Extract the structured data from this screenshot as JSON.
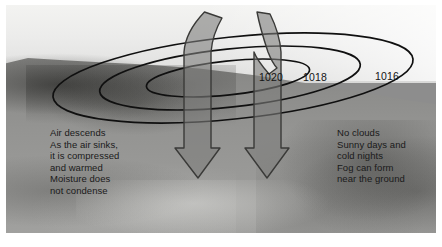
{
  "photo": {
    "description": "grayscale landscape photograph with sloping ridge and sky"
  },
  "isobars": {
    "label_units": "mb",
    "labels": [
      {
        "value": "1020",
        "x": 259,
        "y": 77
      },
      {
        "value": "1018",
        "x": 303,
        "y": 77
      },
      {
        "value": "1016",
        "x": 375,
        "y": 76
      }
    ]
  },
  "arrows": [
    {
      "name": "descending-air-arrow-left",
      "direction": "down"
    },
    {
      "name": "descending-air-arrow-right",
      "direction": "down"
    }
  ],
  "captions": {
    "left": "Air descends\nAs the air sinks,\nit is compressed\nand warmed\nMoisture does\nnot condense",
    "right": "No clouds\nSunny days and\ncold nights\nFog can form\nnear the ground"
  },
  "colors": {
    "isobar_stroke": "#101010",
    "arrow_fill": "rgba(125,125,123,0.60)",
    "arrow_stroke": "#3a3a38",
    "caption_text": "#1a1a1a",
    "page_background": "#ffffff"
  }
}
